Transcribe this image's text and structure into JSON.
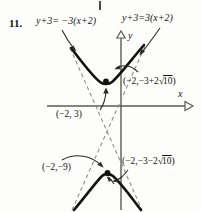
{
  "figure": {
    "problem_number": "11.",
    "equation_left": "y+3= −3(x+2)",
    "equation_right": "y+3=3(x+2)",
    "axis_x_label": "x",
    "axis_y_label": "y",
    "labels": {
      "upper_vertex": "(−2,−3+2√10)",
      "lower_vertex": "(−2,−3−2√10)",
      "center": "(−2, 3)",
      "lower_point": "(−2,−9)"
    },
    "label_parts": {
      "upper_vertex_prefix": "(−2,−3+2",
      "upper_vertex_radicand": "10",
      "upper_vertex_suffix": ")",
      "lower_vertex_prefix": "(−2,−3−2",
      "lower_vertex_radicand": "10",
      "lower_vertex_suffix": ")"
    },
    "colors": {
      "ink": "#141414",
      "axis": "#555555",
      "dash": "#8a8a8a",
      "paper": "#fdfdfb"
    },
    "geometry": {
      "center_x": 121,
      "x_axis_y": 106,
      "upper_vertex": [
        106,
        82
      ],
      "lower_vertex": [
        107,
        174
      ],
      "asymptote_slopes": [
        3,
        -3
      ]
    }
  }
}
